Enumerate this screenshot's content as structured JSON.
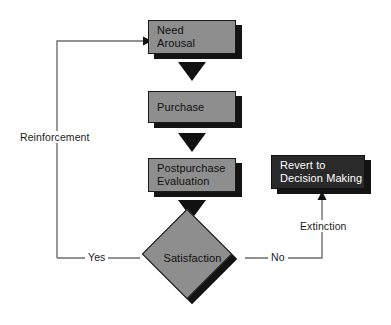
{
  "diagram": {
    "type": "flowchart",
    "colors": {
      "node_fill": "#8e8e8e",
      "node_dark_fill": "#2a2a2a",
      "node_border": "#1a1a1a",
      "shadow": "#131313",
      "line": "#6e6e6e",
      "arrow": "#111111",
      "background": "#ffffff",
      "text_dark": "#101010",
      "text_light": "#ffffff"
    },
    "nodes": [
      {
        "id": "need_arousal",
        "shape": "box",
        "line1": "Need",
        "line2": "Arousal"
      },
      {
        "id": "purchase",
        "shape": "box",
        "line1": "Purchase",
        "line2": ""
      },
      {
        "id": "postpurchase",
        "shape": "box",
        "line1": "Postpurchase",
        "line2": "Evaluation"
      },
      {
        "id": "revert",
        "shape": "box",
        "line1": "Revert to",
        "line2": "Decision Making"
      },
      {
        "id": "satisfaction",
        "shape": "diamond",
        "line1": "Satisfaction",
        "line2": ""
      }
    ],
    "edge_labels": {
      "reinforcement": "Reinforcement",
      "yes": "Yes",
      "no": "No",
      "extinction": "Extinction"
    }
  }
}
